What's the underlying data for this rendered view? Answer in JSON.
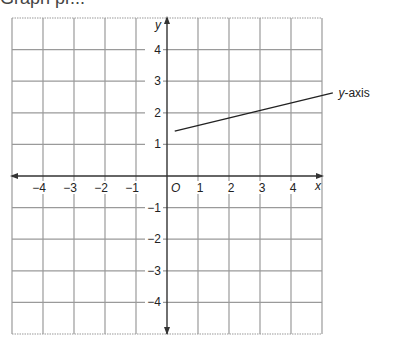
{
  "header": {
    "fragment": "Graph pr..."
  },
  "chart_data": {
    "type": "line",
    "title": "",
    "xlabel": "x",
    "ylabel": "y",
    "origin_label": "O",
    "xlim": [
      -5,
      5
    ],
    "ylim": [
      -5,
      5
    ],
    "grid": true,
    "x_ticks": [
      -4,
      -3,
      -2,
      -1,
      1,
      2,
      3,
      4
    ],
    "y_ticks": [
      -4,
      -3,
      -2,
      -1,
      1,
      2,
      3,
      4
    ],
    "series": [
      {
        "name": "y-axis",
        "x": [
          0.25,
          5.35
        ],
        "y": [
          1.42,
          2.63
        ]
      }
    ],
    "annotations": [
      {
        "text": "y-axis",
        "x": 5.4,
        "y": 2.65
      }
    ]
  },
  "labels": {
    "x": "x",
    "y": "y",
    "origin": "O",
    "line_label": "y-axis"
  }
}
